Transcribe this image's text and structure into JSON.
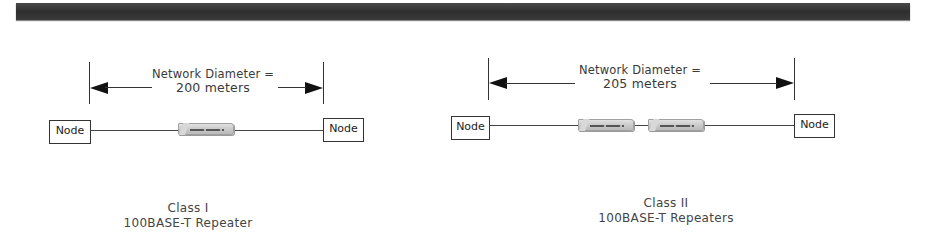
{
  "diagram": {
    "type": "network-topology",
    "panels": [
      {
        "id": "class-1",
        "diameter_label_line1": "Network Diameter =",
        "diameter_label_line2": "200 meters",
        "diameter_meters": 200,
        "nodes": [
          {
            "label": "Node"
          },
          {
            "label": "Node"
          }
        ],
        "repeater_count": 1,
        "caption_line1": "Class I",
        "caption_line2": "100BASE-T Repeater"
      },
      {
        "id": "class-2",
        "diameter_label_line1": "Network Diameter =",
        "diameter_label_line2": "205 meters",
        "diameter_meters": 205,
        "nodes": [
          {
            "label": "Node"
          },
          {
            "label": "Node"
          }
        ],
        "repeater_count": 2,
        "caption_line1": "Class II",
        "caption_line2": "100BASE-T Repeaters"
      }
    ],
    "colors": {
      "header_bar": "#333333",
      "line": "#444444",
      "repeater": "#cccccc",
      "text": "#3a3a3a"
    }
  }
}
